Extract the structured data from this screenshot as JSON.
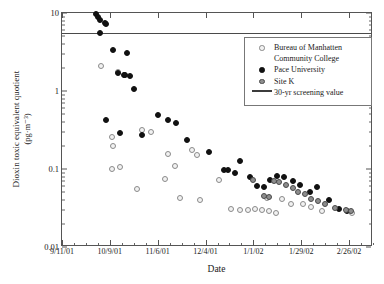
{
  "chart_data": {
    "type": "scatter",
    "title": "",
    "xlabel": "Date",
    "ylabel": "Dioxin toxic equivalent quotient (pg·m⁻³)",
    "ylabel_line1": "Dioxin toxic equivalent quotient",
    "ylabel_line2": "(pg·m⁻³)",
    "yscale": "log",
    "ylim": [
      0.01,
      10
    ],
    "ytick_labels": [
      "10",
      "1",
      "0.1",
      "0.01"
    ],
    "ytick_values": [
      10,
      1,
      0.1,
      0.01
    ],
    "xlim": [
      "9/11/01",
      "3/12/02"
    ],
    "xtick_labels": [
      "9/11/01",
      "10/9/01",
      "11/6/01",
      "12/4/01",
      "1/1/02",
      "1/29/02",
      "2/26/02"
    ],
    "xtick_days": [
      0,
      28,
      56,
      84,
      112,
      140,
      168
    ],
    "grid": false,
    "legend_position": "top-right",
    "annotations": [
      {
        "name": "screening-value-line",
        "type": "hline",
        "value": 5.6,
        "label": "30-yr screening value"
      }
    ],
    "series": [
      {
        "name": "Bureau of Manhatten Community College",
        "key": "bmcc",
        "marker": "open-circle",
        "color": "#f2f2f2",
        "edge_color": "#8a8a8a",
        "points": [
          {
            "day": 23,
            "value": 2.1
          },
          {
            "day": 29,
            "value": 0.1
          },
          {
            "day": 33,
            "value": 1.75
          },
          {
            "day": 29,
            "value": 0.26
          },
          {
            "day": 30,
            "value": 0.2
          },
          {
            "day": 34,
            "value": 0.105
          },
          {
            "day": 44,
            "value": 0.055
          },
          {
            "day": 47,
            "value": 0.32
          },
          {
            "day": 52,
            "value": 0.3
          },
          {
            "day": 62,
            "value": 0.155
          },
          {
            "day": 66,
            "value": 0.11
          },
          {
            "day": 60,
            "value": 0.075
          },
          {
            "day": 69,
            "value": 0.042
          },
          {
            "day": 76,
            "value": 0.175
          },
          {
            "day": 79,
            "value": 0.15
          },
          {
            "day": 81,
            "value": 0.04
          },
          {
            "day": 92,
            "value": 0.072
          },
          {
            "day": 99,
            "value": 0.031
          },
          {
            "day": 104,
            "value": 0.03
          },
          {
            "day": 109,
            "value": 0.03
          },
          {
            "day": 113,
            "value": 0.031
          },
          {
            "day": 117,
            "value": 0.03
          },
          {
            "day": 121,
            "value": 0.029
          },
          {
            "day": 125,
            "value": 0.027
          },
          {
            "day": 120,
            "value": 0.042
          },
          {
            "day": 129,
            "value": 0.041
          },
          {
            "day": 134,
            "value": 0.036
          },
          {
            "day": 141,
            "value": 0.036
          },
          {
            "day": 146,
            "value": 0.033
          },
          {
            "day": 152,
            "value": 0.029
          },
          {
            "day": 170,
            "value": 0.027
          }
        ]
      },
      {
        "name": "Pace University",
        "key": "pace",
        "marker": "filled-circle",
        "color": "#111111",
        "points": [
          {
            "day": 20,
            "value": 9.6
          },
          {
            "day": 21,
            "value": 9.0
          },
          {
            "day": 22,
            "value": 8.2
          },
          {
            "day": 25,
            "value": 7.4
          },
          {
            "day": 26,
            "value": 7.3
          },
          {
            "day": 22,
            "value": 5.6
          },
          {
            "day": 30,
            "value": 3.4
          },
          {
            "day": 38,
            "value": 3.1
          },
          {
            "day": 33,
            "value": 1.7
          },
          {
            "day": 36,
            "value": 1.62
          },
          {
            "day": 37,
            "value": 1.6
          },
          {
            "day": 40,
            "value": 1.55
          },
          {
            "day": 42,
            "value": 1.05
          },
          {
            "day": 26,
            "value": 0.43
          },
          {
            "day": 34,
            "value": 0.29
          },
          {
            "day": 47,
            "value": 0.27
          },
          {
            "day": 56,
            "value": 0.49
          },
          {
            "day": 62,
            "value": 0.43
          },
          {
            "day": 67,
            "value": 0.39
          },
          {
            "day": 73,
            "value": 0.235
          },
          {
            "day": 86,
            "value": 0.165
          },
          {
            "day": 95,
            "value": 0.098
          },
          {
            "day": 97,
            "value": 0.097
          },
          {
            "day": 104,
            "value": 0.128
          },
          {
            "day": 101,
            "value": 0.088
          },
          {
            "day": 110,
            "value": 0.078
          },
          {
            "day": 114,
            "value": 0.06
          },
          {
            "day": 118,
            "value": 0.058
          },
          {
            "day": 122,
            "value": 0.073
          },
          {
            "day": 126,
            "value": 0.082
          },
          {
            "day": 130,
            "value": 0.078
          },
          {
            "day": 135,
            "value": 0.07
          },
          {
            "day": 139,
            "value": 0.062
          },
          {
            "day": 145,
            "value": 0.05
          },
          {
            "day": 149,
            "value": 0.058
          },
          {
            "day": 156,
            "value": 0.04
          },
          {
            "day": 162,
            "value": 0.031
          },
          {
            "day": 167,
            "value": 0.029
          }
        ]
      },
      {
        "name": "Site K",
        "key": "sitek",
        "marker": "gray-circle",
        "color": "#8d8d8d",
        "edge_color": "#4a4a4a",
        "points": [
          {
            "day": 112,
            "value": 0.072
          },
          {
            "day": 118,
            "value": 0.045
          },
          {
            "day": 121,
            "value": 0.044
          },
          {
            "day": 124,
            "value": 0.07
          },
          {
            "day": 127,
            "value": 0.068
          },
          {
            "day": 131,
            "value": 0.062
          },
          {
            "day": 135,
            "value": 0.057
          },
          {
            "day": 138,
            "value": 0.051
          },
          {
            "day": 142,
            "value": 0.048
          },
          {
            "day": 146,
            "value": 0.041
          },
          {
            "day": 150,
            "value": 0.039
          },
          {
            "day": 154,
            "value": 0.036
          },
          {
            "day": 160,
            "value": 0.032
          },
          {
            "day": 166,
            "value": 0.03
          },
          {
            "day": 169,
            "value": 0.029
          }
        ]
      }
    ]
  },
  "legend": {
    "items": [
      {
        "label": "Bureau of Manhatten Community College",
        "symbol": "bmcc"
      },
      {
        "label": "Pace University",
        "symbol": "pace"
      },
      {
        "label": "Site K",
        "symbol": "sitek"
      },
      {
        "label": "30-yr screening value",
        "symbol": "line"
      }
    ]
  }
}
